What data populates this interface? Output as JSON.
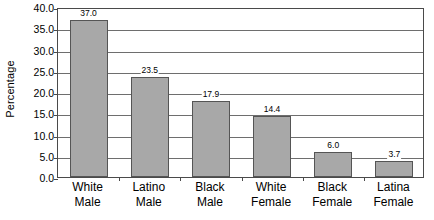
{
  "chart_data": {
    "type": "bar",
    "title": "",
    "subtitle": "",
    "xlabel": "",
    "ylabel": "Percentage",
    "ylim": [
      0,
      40
    ],
    "ytick_step": 5,
    "ytick_labels": [
      "40.0",
      "35.0",
      "30.0",
      "25.0",
      "20.0",
      "15.0",
      "10.0",
      "5.0",
      "0.0"
    ],
    "ytick_values": [
      40,
      35,
      30,
      25,
      20,
      15,
      10,
      5,
      0
    ],
    "categories": [
      "White Male",
      "Latino Male",
      "Black Male",
      "White Female",
      "Black Female",
      "Latina Female"
    ],
    "category_lines": [
      [
        "White",
        "Male"
      ],
      [
        "Latino",
        "Male"
      ],
      [
        "Black",
        "Male"
      ],
      [
        "White",
        "Female"
      ],
      [
        "Black",
        "Female"
      ],
      [
        "Latina",
        "Female"
      ]
    ],
    "values": [
      37.0,
      23.5,
      17.9,
      14.4,
      6.0,
      3.7
    ],
    "value_labels": [
      "37.0",
      "23.5",
      "17.9",
      "14.4",
      "6.0",
      "3.7"
    ],
    "grid": true,
    "grid_axis": "y",
    "legend": false,
    "legend_position": "none",
    "colors": {
      "bar_fill": "#a8a8a8",
      "bar_border": "#555555",
      "gridline": "#6e6e6e",
      "axis": "#4a4a4a",
      "text": "#000000",
      "background": "#ffffff"
    }
  }
}
